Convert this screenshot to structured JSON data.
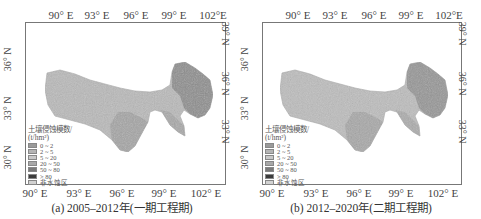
{
  "figure": {
    "panels": [
      {
        "id": "a",
        "caption": "(a) 2005–2012年(一期工程期)",
        "x_ticks_top": [
          "90° E",
          "93° E",
          "96° E",
          "99° E",
          "102°E"
        ],
        "x_ticks_bottom": [
          "90° E",
          "93° E",
          "96° E",
          "99° E",
          "102° E"
        ],
        "y_ticks_left": [
          "36° N",
          "33° N",
          "30° N"
        ],
        "y_ticks_right": [
          "39° N",
          "36° N",
          "33° N"
        ]
      },
      {
        "id": "b",
        "caption": "(b) 2012–2020年(二期工程期)",
        "x_ticks_top": [
          "90° E",
          "93° E",
          "96° E",
          "99° E",
          "102°E"
        ],
        "x_ticks_bottom": [
          "90° E",
          "93° E",
          "96° E",
          "99° E",
          "102° E"
        ],
        "y_ticks_left": [
          "36° N",
          "33° N",
          "30° N"
        ],
        "y_ticks_right": [
          "39° N",
          "36° N",
          "33° N"
        ]
      }
    ],
    "legend": {
      "title": "土壤侵蚀模数/",
      "unit": "(t/hm²)",
      "items": [
        {
          "label": "0 ~ 2",
          "color": "#9a9a9a"
        },
        {
          "label": "2 ~ 5",
          "color": "#b4b4b4"
        },
        {
          "label": "5 ~ 20",
          "color": "#c8c8c8"
        },
        {
          "label": "20 ~ 50",
          "color": "#a8a8a8"
        },
        {
          "label": "50 ~ 80",
          "color": "#7a7a7a"
        },
        {
          "label": "> 80",
          "color": "#3c3c3c"
        },
        {
          "label": "非水蚀区",
          "color": "#d2d2d2"
        }
      ]
    },
    "colors": {
      "region_base": "#b9b9b9",
      "region_ne": "#8f8f8f",
      "region_se": "#a3a3a3",
      "frame": "#777777"
    }
  }
}
